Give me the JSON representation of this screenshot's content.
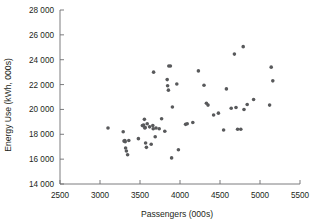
{
  "chart_data": {
    "type": "scatter",
    "title": "",
    "xlabel": "Passengers (000s)",
    "ylabel": "Energy Use (kWh, 000s)",
    "xlim": [
      2500,
      5500
    ],
    "ylim": [
      14000,
      28000
    ],
    "xticks": [
      2500,
      3000,
      3500,
      4000,
      4500,
      5000,
      5500
    ],
    "yticks": [
      14000,
      16000,
      18000,
      20000,
      22000,
      24000,
      26000,
      28000
    ],
    "xtick_labels": [
      "2500",
      "3000",
      "3500",
      "4000",
      "4500",
      "5000",
      "5500"
    ],
    "ytick_labels": [
      "14 000",
      "16 000",
      "18 000",
      "20 000",
      "22 000",
      "24 000",
      "26 000",
      "28 000"
    ],
    "grid": false,
    "legend": null,
    "marker": {
      "shape": "circle",
      "color": "#58595b",
      "size": 1.8
    },
    "points": [
      [
        3100,
        18500
      ],
      [
        3290,
        18200
      ],
      [
        3300,
        17450
      ],
      [
        3310,
        17500
      ],
      [
        3315,
        17400
      ],
      [
        3320,
        16900
      ],
      [
        3330,
        16650
      ],
      [
        3345,
        16350
      ],
      [
        3360,
        17500
      ],
      [
        3480,
        17650
      ],
      [
        3530,
        18700
      ],
      [
        3545,
        18750
      ],
      [
        3555,
        19200
      ],
      [
        3560,
        18500
      ],
      [
        3565,
        18550
      ],
      [
        3570,
        17300
      ],
      [
        3580,
        16950
      ],
      [
        3590,
        18850
      ],
      [
        3620,
        18600
      ],
      [
        3640,
        17200
      ],
      [
        3660,
        18700
      ],
      [
        3665,
        18450
      ],
      [
        3670,
        23000
      ],
      [
        3690,
        17800
      ],
      [
        3700,
        18500
      ],
      [
        3740,
        18450
      ],
      [
        3770,
        19250
      ],
      [
        3810,
        18250
      ],
      [
        3840,
        22400
      ],
      [
        3845,
        21900
      ],
      [
        3855,
        21550
      ],
      [
        3860,
        23500
      ],
      [
        3880,
        23500
      ],
      [
        3895,
        16100
      ],
      [
        3905,
        20200
      ],
      [
        3960,
        22050
      ],
      [
        3980,
        16750
      ],
      [
        4070,
        18800
      ],
      [
        4090,
        18850
      ],
      [
        4160,
        18950
      ],
      [
        4230,
        23100
      ],
      [
        4300,
        21950
      ],
      [
        4330,
        20500
      ],
      [
        4350,
        20350
      ],
      [
        4420,
        19550
      ],
      [
        4480,
        19700
      ],
      [
        4545,
        18350
      ],
      [
        4580,
        21650
      ],
      [
        4640,
        20100
      ],
      [
        4680,
        24450
      ],
      [
        4700,
        20150
      ],
      [
        4720,
        18400
      ],
      [
        4760,
        18400
      ],
      [
        4790,
        25050
      ],
      [
        4800,
        20000
      ],
      [
        4840,
        20400
      ],
      [
        4920,
        20800
      ],
      [
        5120,
        20350
      ],
      [
        5140,
        23400
      ],
      [
        5160,
        22300
      ]
    ]
  }
}
